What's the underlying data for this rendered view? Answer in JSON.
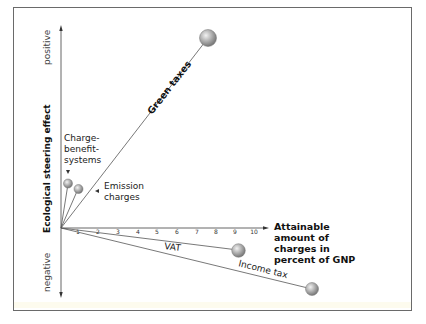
{
  "diagram": {
    "y_axis": {
      "label": "Ecological steering effect",
      "positive_label": "positive",
      "negative_label": "negative"
    },
    "x_axis": {
      "label_lines": [
        "Attainable",
        "amount of",
        "charges in",
        "percent of GNP"
      ],
      "ticks": [
        "1",
        "2",
        "3",
        "4",
        "5",
        "6",
        "7",
        "8",
        "9",
        "10"
      ]
    },
    "instruments": [
      {
        "name": "Green taxes",
        "charge_percent_gnp": 7.5,
        "effect": "strongly positive"
      },
      {
        "name_lines": [
          "Charge-",
          "benefit-",
          "systems"
        ],
        "name": "Charge-benefit-systems",
        "charge_percent_gnp": 0.4,
        "effect": "positive"
      },
      {
        "name_lines": [
          "Emission",
          "charges"
        ],
        "name": "Emission charges",
        "charge_percent_gnp": 0.9,
        "effect": "positive"
      },
      {
        "name": "VAT",
        "charge_percent_gnp": 8.9,
        "effect": "slightly negative"
      },
      {
        "name": "Income tax",
        "charge_percent_gnp": 12.6,
        "effect": "negative"
      }
    ],
    "colors": {
      "frame": "#6a6a6a",
      "line": "#555555",
      "ball_light": "#e8e8e8",
      "ball_dark": "#7a7a7a"
    }
  }
}
